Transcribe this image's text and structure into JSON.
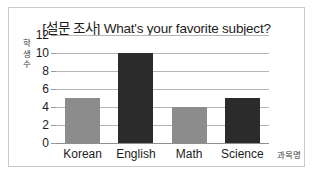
{
  "chart_data": {
    "type": "bar",
    "title": "[설문 조사] What's your favorite subject?",
    "categories": [
      "Korean",
      "English",
      "Math",
      "Science"
    ],
    "values": [
      5,
      10,
      4,
      5
    ],
    "bar_colors": [
      "#8c8c8c",
      "#2b2b2b",
      "#8c8c8c",
      "#2b2b2b"
    ],
    "xlabel": "과목명",
    "ylabel": "학생수",
    "ylabel_chars": [
      "학",
      "생",
      "수"
    ],
    "ylim": [
      0,
      12
    ],
    "yticks": [
      12,
      10,
      8,
      6,
      4,
      2,
      0
    ],
    "ytick_labels": [
      "12",
      "10",
      "8",
      "6",
      "4",
      "2",
      "0"
    ],
    "grid": true,
    "legend": null,
    "frame_color": "#c9c9c9",
    "gridline_color": "#b6b6b6",
    "text_color": "#1c1c1c"
  }
}
